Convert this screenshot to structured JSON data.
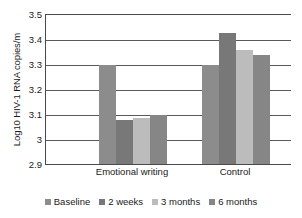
{
  "chart_data": {
    "type": "bar",
    "title": "",
    "xlabel": "",
    "ylabel": "Log10 HIV-1 RNA copies/m",
    "ylim": [
      2.9,
      3.5
    ],
    "yticks": [
      "2.9",
      "3",
      "3.1",
      "3.2",
      "3.3",
      "3.4",
      "3.5"
    ],
    "ytick_values": [
      2.9,
      3.0,
      3.1,
      3.2,
      3.3,
      3.4,
      3.5
    ],
    "grid": true,
    "legend_position": "bottom",
    "categories": [
      "Emotional writing",
      "Control"
    ],
    "series": [
      {
        "name": "Baseline",
        "values": [
          3.3,
          3.3
        ],
        "color": "#8c8c8c"
      },
      {
        "name": "2 weeks",
        "values": [
          3.08,
          3.43
        ],
        "color": "#787878"
      },
      {
        "name": "3 months",
        "values": [
          3.09,
          3.36
        ],
        "color": "#bcbcbc"
      },
      {
        "name": "6 months",
        "values": [
          3.1,
          3.34
        ],
        "color": "#868686"
      }
    ]
  },
  "legend": {
    "items": [
      {
        "label": "Baseline",
        "color": "#8c8c8c"
      },
      {
        "label": "2 weeks",
        "color": "#787878"
      },
      {
        "label": "3 months",
        "color": "#bcbcbc"
      },
      {
        "label": "6 months",
        "color": "#868686"
      }
    ]
  },
  "axes": {
    "y_title": "Log10 HIV-1 RNA copies/m",
    "y_ticks": [
      "3.5",
      "3.4",
      "3.3",
      "3.2",
      "3.1",
      "3",
      "2.9"
    ],
    "x_categories": [
      "Emotional writing",
      "Control"
    ]
  }
}
